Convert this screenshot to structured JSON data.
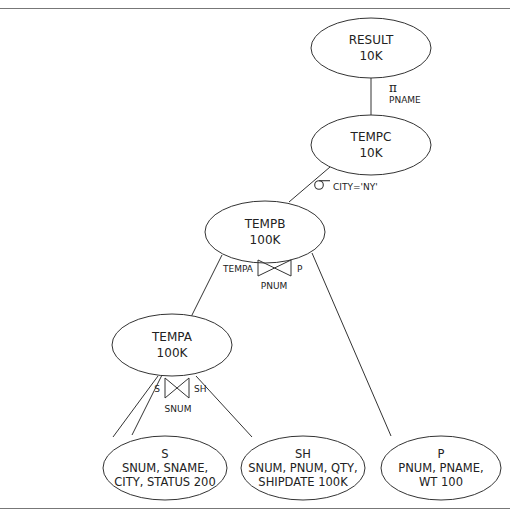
{
  "diagram": {
    "type": "query-tree",
    "nodes": [
      {
        "id": "result",
        "lines": [
          "RESULT",
          "10K"
        ]
      },
      {
        "id": "tempc",
        "lines": [
          "TEMPC",
          "10K"
        ]
      },
      {
        "id": "tempb",
        "lines": [
          "TEMPB",
          "100K"
        ]
      },
      {
        "id": "tempa",
        "lines": [
          "TEMPA",
          "100K"
        ]
      },
      {
        "id": "s",
        "lines": [
          "S",
          "SNUM, SNAME,",
          "CITY, STATUS 200"
        ]
      },
      {
        "id": "sh",
        "lines": [
          "SH",
          "SNUM, PNUM, QTY,",
          "SHIPDATE 100K"
        ]
      },
      {
        "id": "p",
        "lines": [
          "P",
          "PNUM, PNAME,",
          "WT 100"
        ]
      }
    ],
    "edges": [
      {
        "from": "result",
        "to": "tempc"
      },
      {
        "from": "tempc",
        "to": "tempb"
      },
      {
        "from": "tempb",
        "to": "tempa"
      },
      {
        "from": "tempb",
        "to": "p"
      },
      {
        "from": "tempa",
        "to": "s"
      },
      {
        "from": "tempa",
        "to": "sh"
      }
    ],
    "operations": {
      "projection": {
        "symbol": "π",
        "attribute": "PNAME"
      },
      "selection": {
        "symbol": "σ",
        "condition": "CITY='NY'"
      },
      "join_tempb": {
        "left": "TEMPA",
        "right": "P",
        "attribute": "PNUM"
      },
      "join_tempa": {
        "left": "S",
        "right": "SH",
        "attribute": "SNUM"
      }
    }
  }
}
